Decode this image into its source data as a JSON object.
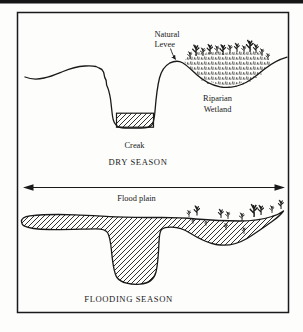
{
  "page": {
    "background": "#ffffff",
    "ink": "#1a1a1a"
  },
  "diagram": {
    "dry_panel": {
      "natural_levee_label_line1": "Natural",
      "natural_levee_label_line2": "Levee",
      "riparian_label_line1": "Riparian",
      "riparian_label_line2": "Wetland",
      "creek_label": "Creak",
      "season_label": "DRY SEASON"
    },
    "flood_plain_label": "Flood plain",
    "flood_panel": {
      "season_label": "FLOODING SEASON"
    }
  }
}
